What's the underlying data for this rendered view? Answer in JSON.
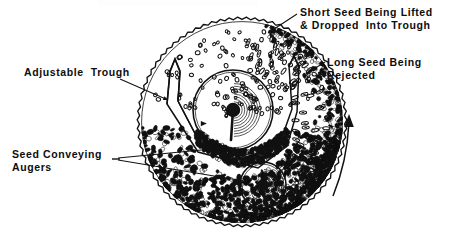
{
  "figure": {
    "background_color": "#ffffff",
    "ink_color": "#111111"
  },
  "labels": {
    "short_seed": {
      "line1": "Short Seed Being Lifted",
      "line2": "& Dropped  Into Trough",
      "name": "short-seed-label"
    },
    "long_seed": {
      "line1": "Long Seed Being",
      "line2": "Rejected",
      "name": "long-seed-label"
    },
    "adjustable_trough": {
      "line1": "Adjustable  Trough",
      "name": "adjustable-trough-label"
    },
    "seed_augers": {
      "line1": "Seed Conveying",
      "line2": "Augers",
      "name": "seed-conveying-augers-label"
    }
  },
  "diagram": {
    "drum": {
      "cx": 242,
      "cy": 122,
      "r": 103,
      "rim_style": "serrated-indented",
      "teeth": 150
    },
    "rotation": {
      "direction": "counter-clockwise",
      "arrow_side": "right"
    },
    "augers": [
      {
        "name": "upper-auger",
        "cx": 233,
        "cy": 110,
        "r": 40
      },
      {
        "name": "lower-auger",
        "cx": 263,
        "cy": 185,
        "r": 23
      }
    ],
    "trough": {
      "name": "adjustable-trough",
      "points": "167,104 170,71 175,59 180,71 178,101 200,143 252,158 281,140 292,109 289,66 294,56 299,67 297,112 287,146 258,168 198,152"
    },
    "seed_regions": [
      {
        "name": "short-seed-cloud",
        "type": "round-open",
        "count": 78
      },
      {
        "name": "long-seed-band",
        "type": "elongated-open",
        "count": 46
      },
      {
        "name": "seed-mass-bottom",
        "type": "dense-dark",
        "count": 900
      },
      {
        "name": "trough-fill",
        "type": "dense-dark",
        "count": 420
      }
    ],
    "leaders": [
      {
        "name": "short-seed-leader",
        "from": [
          297,
          14
        ],
        "to": [
          268,
          33
        ]
      },
      {
        "name": "long-seed-leader",
        "from": [
          325,
          62
        ],
        "to": [
          306,
          74
        ]
      },
      {
        "name": "trough-leader",
        "from": [
          120,
          79
        ],
        "to": [
          168,
          100
        ]
      },
      {
        "name": "auger-leader-upper",
        "from": [
          118,
          158
        ],
        "to": [
          222,
          148
        ]
      },
      {
        "name": "auger-leader-lower",
        "from": [
          118,
          160
        ],
        "to": [
          250,
          182
        ]
      }
    ]
  }
}
